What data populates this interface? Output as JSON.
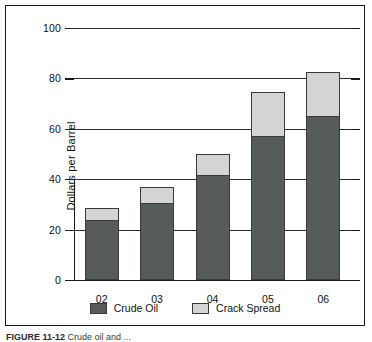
{
  "chart_data": {
    "type": "bar",
    "subtype": "stacked-bar",
    "title": "",
    "xlabel": "",
    "ylabel": "Dollars per Barrel",
    "categories": [
      "02",
      "03",
      "04",
      "05",
      "06"
    ],
    "series": [
      {
        "name": "Crude Oil",
        "color": "#555a5a",
        "values": [
          24,
          30.5,
          41.5,
          57,
          65
        ]
      },
      {
        "name": "Crack Spread",
        "color": "#d4d4d4",
        "values": [
          4.5,
          6.5,
          8.5,
          17.5,
          17.5
        ]
      }
    ],
    "totals": [
      28.5,
      37,
      50,
      74.5,
      82.5
    ],
    "ylim": [
      0,
      100
    ],
    "yticks": [
      0,
      20,
      40,
      60,
      80,
      100
    ],
    "ytick_labels": [
      "0",
      "20",
      "40",
      "60",
      "80",
      "100"
    ],
    "grid": true,
    "legend_position": "bottom"
  },
  "axis": {
    "y_title": "Dollars per Barrel"
  },
  "legend": {
    "items": [
      {
        "label": "Crude Oil",
        "swatch": "crude-oil-swatch"
      },
      {
        "label": "Crack Spread",
        "swatch": "crack-spread-swatch"
      }
    ]
  },
  "caption": {
    "figure_label": "FIGURE 11-12",
    "figure_text": "Crude oil and ..."
  },
  "colors": {
    "crude_oil": "#555a5a",
    "crack_spread": "#d4d4d4",
    "frame": "#1a1a1a",
    "gridline": "#2b2b2b",
    "background": "#ffffff"
  }
}
